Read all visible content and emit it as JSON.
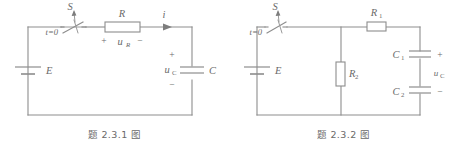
{
  "document": {
    "kind": "textbook-figure-pair",
    "line_color": "#8d8d8d",
    "text_color": "#6a6a6a",
    "background": "#ffffff"
  },
  "figures": [
    {
      "id": "fig-2-3-1",
      "caption": "题 2.3.1 图",
      "labels": {
        "source": "E",
        "switch": "S",
        "switch_time": "t=0",
        "resistor": "R",
        "resistor_voltage": "u",
        "resistor_voltage_sub": "R",
        "resistor_plus": "+",
        "resistor_minus": "−",
        "current": "i",
        "capacitor": "C",
        "capacitor_voltage": "u",
        "capacitor_voltage_sub": "C",
        "capacitor_plus": "+",
        "capacitor_minus": "−"
      }
    },
    {
      "id": "fig-2-3-2",
      "caption": "题 2.3.2 图",
      "labels": {
        "source": "E",
        "switch": "S",
        "switch_time": "t=0",
        "resistor1": "R",
        "resistor1_sub": "1",
        "resistor2": "R",
        "resistor2_sub": "2",
        "capacitor1": "C",
        "capacitor1_sub": "1",
        "capacitor2": "C",
        "capacitor2_sub": "2",
        "capacitor_voltage": "u",
        "capacitor_voltage_sub": "C",
        "capacitor_plus": "+",
        "capacitor_minus": "−"
      }
    }
  ]
}
